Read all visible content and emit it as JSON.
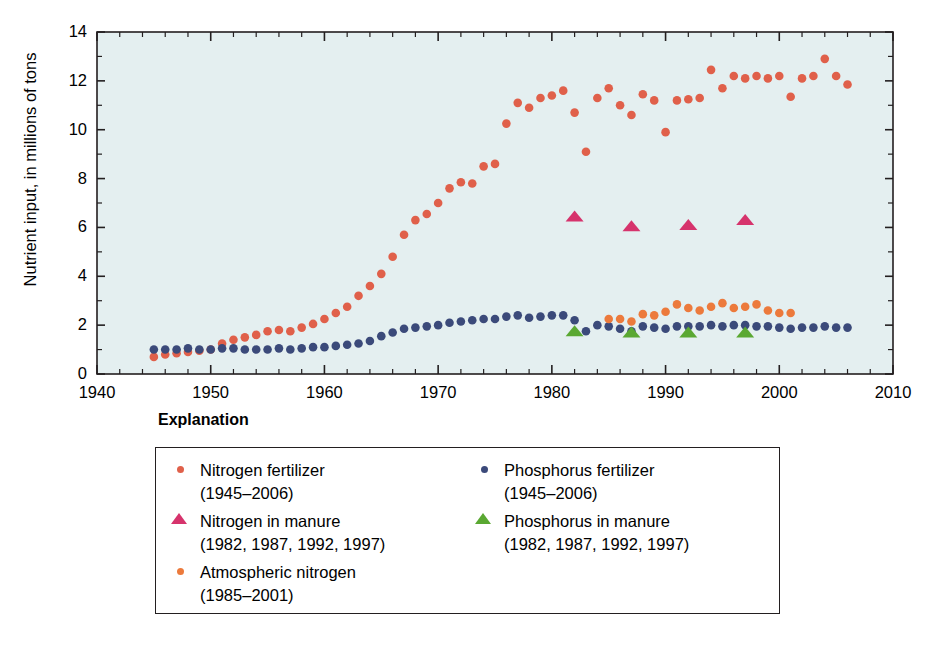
{
  "axes": {
    "ylabel": "Nutrient input, in millions of tons",
    "yticks": [
      "0",
      "2",
      "4",
      "6",
      "8",
      "10",
      "12",
      "14"
    ],
    "xticks": [
      "1940",
      "1950",
      "1960",
      "1970",
      "1980",
      "1990",
      "2000",
      "2010"
    ]
  },
  "explanation": {
    "title": "Explanation",
    "entries": [
      {
        "marker": "circle",
        "color": "#e0604a",
        "label": "Nitrogen fertilizer",
        "range": "(1945–2006)",
        "column": "left"
      },
      {
        "marker": "triangle",
        "color": "#d6336c",
        "label": "Nitrogen in manure",
        "range": "(1982, 1987, 1992, 1997)",
        "column": "left"
      },
      {
        "marker": "circle",
        "color": "#ec7a3c",
        "label": "Atmospheric nitrogen",
        "range": "(1985–2001)",
        "column": "left"
      },
      {
        "marker": "circle",
        "color": "#3b4a7a",
        "label": "Phosphorus fertilizer",
        "range": "(1945–2006)",
        "column": "right"
      },
      {
        "marker": "triangle",
        "color": "#5aa832",
        "label": "Phosphorus in manure",
        "range": "(1982, 1987, 1992, 1997)",
        "column": "right"
      }
    ]
  },
  "colors": {
    "plot_background": "#e4eff0",
    "plot_border": "#231f20",
    "nitrogen_fertilizer": "#e0604a",
    "phosphorus_fertilizer": "#3b4a7a",
    "nitrogen_manure": "#d6336c",
    "phosphorus_manure": "#5aa832",
    "atmospheric_nitrogen": "#ec7a3c"
  },
  "chart_data": {
    "type": "scatter",
    "title": "",
    "xlabel": "",
    "ylabel": "Nutrient input, in millions of tons",
    "xlim": [
      1940,
      2010
    ],
    "ylim": [
      0,
      14
    ],
    "xticks": [
      1940,
      1950,
      1960,
      1970,
      1980,
      1990,
      2000,
      2010
    ],
    "yticks": [
      0,
      2,
      4,
      6,
      8,
      10,
      12,
      14
    ],
    "minor_ticks": {
      "x_interval": 2,
      "y_interval": 1
    },
    "grid": false,
    "legend_position": "below-plot",
    "legend_title": "Explanation",
    "series": [
      {
        "name": "Nitrogen fertilizer",
        "years_label": "(1945–2006)",
        "marker": "circle",
        "color": "#e0604a",
        "x": [
          1945,
          1946,
          1947,
          1948,
          1949,
          1950,
          1951,
          1952,
          1953,
          1954,
          1955,
          1956,
          1957,
          1958,
          1959,
          1960,
          1961,
          1962,
          1963,
          1964,
          1965,
          1966,
          1967,
          1968,
          1969,
          1970,
          1971,
          1972,
          1973,
          1974,
          1975,
          1976,
          1977,
          1978,
          1979,
          1980,
          1981,
          1982,
          1983,
          1984,
          1985,
          1986,
          1987,
          1988,
          1989,
          1990,
          1991,
          1992,
          1993,
          1994,
          1995,
          1996,
          1997,
          1998,
          1999,
          2000,
          2001,
          2002,
          2003,
          2004,
          2005,
          2006
        ],
        "y": [
          0.7,
          0.8,
          0.85,
          0.9,
          0.95,
          1.0,
          1.25,
          1.4,
          1.5,
          1.6,
          1.75,
          1.8,
          1.75,
          1.9,
          2.05,
          2.25,
          2.5,
          2.75,
          3.2,
          3.6,
          4.1,
          4.8,
          5.7,
          6.3,
          6.55,
          7.0,
          7.6,
          7.85,
          7.8,
          8.5,
          8.6,
          10.25,
          11.1,
          10.9,
          11.3,
          11.4,
          11.6,
          10.7,
          9.1,
          11.3,
          11.7,
          11.0,
          10.6,
          11.45,
          11.2,
          9.9,
          11.2,
          11.25,
          11.3,
          12.45,
          11.7,
          12.2,
          12.1,
          12.2,
          12.1,
          12.2,
          11.35,
          12.1,
          12.2,
          12.9,
          12.2,
          11.85
        ]
      },
      {
        "name": "Phosphorus fertilizer",
        "years_label": "(1945–2006)",
        "marker": "circle",
        "color": "#3b4a7a",
        "x": [
          1945,
          1946,
          1947,
          1948,
          1949,
          1950,
          1951,
          1952,
          1953,
          1954,
          1955,
          1956,
          1957,
          1958,
          1959,
          1960,
          1961,
          1962,
          1963,
          1964,
          1965,
          1966,
          1967,
          1968,
          1969,
          1970,
          1971,
          1972,
          1973,
          1974,
          1975,
          1976,
          1977,
          1978,
          1979,
          1980,
          1981,
          1982,
          1983,
          1984,
          1985,
          1986,
          1987,
          1988,
          1989,
          1990,
          1991,
          1992,
          1993,
          1994,
          1995,
          1996,
          1997,
          1998,
          1999,
          2000,
          2001,
          2002,
          2003,
          2004,
          2005,
          2006
        ],
        "y": [
          1.0,
          1.0,
          1.0,
          1.05,
          1.0,
          1.0,
          1.05,
          1.05,
          1.0,
          1.0,
          1.0,
          1.05,
          1.0,
          1.05,
          1.1,
          1.1,
          1.15,
          1.2,
          1.25,
          1.35,
          1.55,
          1.7,
          1.85,
          1.9,
          1.95,
          2.0,
          2.1,
          2.15,
          2.2,
          2.25,
          2.25,
          2.35,
          2.4,
          2.3,
          2.35,
          2.4,
          2.4,
          2.2,
          1.75,
          2.0,
          1.95,
          1.85,
          1.75,
          1.95,
          1.9,
          1.85,
          1.95,
          1.95,
          1.95,
          2.0,
          1.95,
          2.0,
          2.0,
          1.95,
          1.95,
          1.9,
          1.85,
          1.9,
          1.9,
          1.95,
          1.9,
          1.9
        ]
      },
      {
        "name": "Atmospheric nitrogen",
        "years_label": "(1985–2001)",
        "marker": "circle",
        "color": "#ec7a3c",
        "x": [
          1985,
          1986,
          1987,
          1988,
          1989,
          1990,
          1991,
          1992,
          1993,
          1994,
          1995,
          1996,
          1997,
          1998,
          1999,
          2000,
          2001
        ],
        "y": [
          2.25,
          2.25,
          2.15,
          2.45,
          2.4,
          2.55,
          2.85,
          2.7,
          2.6,
          2.75,
          2.9,
          2.7,
          2.75,
          2.85,
          2.6,
          2.5,
          2.5
        ]
      },
      {
        "name": "Nitrogen in manure",
        "years_label": "(1982, 1987, 1992, 1997)",
        "marker": "triangle",
        "color": "#d6336c",
        "x": [
          1982,
          1987,
          1992,
          1997
        ],
        "y": [
          6.45,
          6.05,
          6.1,
          6.3
        ]
      },
      {
        "name": "Phosphorus in manure",
        "years_label": "(1982, 1987, 1992, 1997)",
        "marker": "triangle",
        "color": "#5aa832",
        "x": [
          1982,
          1987,
          1992,
          1997
        ],
        "y": [
          1.75,
          1.7,
          1.7,
          1.7
        ]
      }
    ]
  }
}
